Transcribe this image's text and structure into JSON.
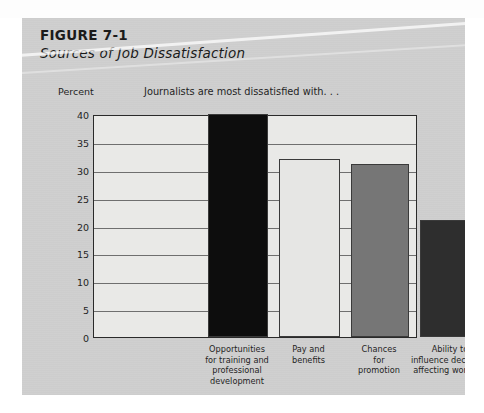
{
  "figure": {
    "label": "FIGURE 7-1",
    "title": "Sources of Job Dissatisfaction"
  },
  "colors": {
    "panel_background": "#cfcfcf",
    "plot_background": "#e9e9e7",
    "frame": "#2a2a2a",
    "gridline": "#6f6f6f",
    "bar_1": "#0d0d0d",
    "bar_2": "#e6e6e4",
    "bar_3": "#767676",
    "bar_4": "#2e2e2e",
    "text": "#1f1f1f"
  },
  "chart_data": {
    "type": "bar",
    "title": "Journalists are most dissatisfied with. . .",
    "xlabel": "",
    "ylabel": "Percent",
    "ylim": [
      0,
      40
    ],
    "yticks": [
      0,
      5,
      10,
      15,
      20,
      25,
      30,
      35,
      40
    ],
    "ytick_labels": [
      "0",
      "5",
      "10",
      "15",
      "20",
      "25",
      "30",
      "35",
      "40"
    ],
    "grid": true,
    "legend": "none",
    "categories": [
      "Opportunities for training and professional development",
      "Pay and benefits",
      "Chances for promotion",
      "Ability to influence decisions affecting work life"
    ],
    "category_lines": [
      [
        "Opportunities",
        "for training and",
        "professional",
        "development"
      ],
      [
        "Pay and",
        "benefits"
      ],
      [
        "Chances",
        "for",
        "promotion"
      ],
      [
        "Ability to",
        "influence decisions",
        "affecting work life"
      ]
    ],
    "values": [
      40,
      32,
      31,
      21
    ],
    "bar_colors": [
      "#0d0d0d",
      "#e6e6e4",
      "#767676",
      "#2e2e2e"
    ]
  }
}
